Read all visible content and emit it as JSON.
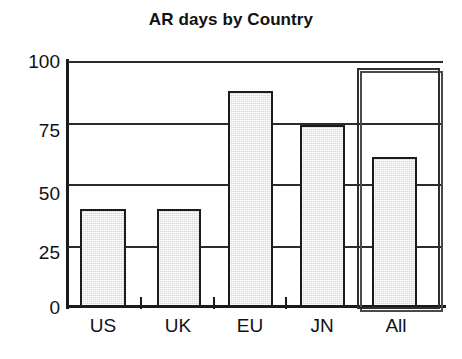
{
  "chart_data": {
    "type": "bar",
    "title": "AR days by Country",
    "xlabel": "",
    "ylabel": "",
    "categories": [
      "US",
      "UK",
      "EU",
      "JN",
      "All"
    ],
    "values": [
      40,
      40,
      88,
      74,
      61
    ],
    "ylim": [
      0,
      100
    ],
    "yticks": [
      0,
      25,
      50,
      75,
      100
    ],
    "ytick_labels": [
      "0",
      "25",
      "50",
      "75",
      "100"
    ],
    "grid": true,
    "legend": false,
    "legend_position": "none",
    "annotations": [
      {
        "name": "highlight-box",
        "target_category": "All",
        "style": "double-line rectangle",
        "spans_full_plot_height": true
      }
    ],
    "series": [
      {
        "name": "AR days",
        "values": [
          40,
          40,
          88,
          74,
          61
        ],
        "fill": "#d6d6d6",
        "edge": "#1c1c1c",
        "pattern": "stippled-gray"
      }
    ]
  },
  "colors": {
    "background": "#ffffff",
    "ink": "#111111",
    "bar_fill": "#d6d6d6",
    "bar_edge": "#1c1c1c",
    "gridline": "#2b2b2b",
    "highlight_box": "#2e2e2e"
  }
}
